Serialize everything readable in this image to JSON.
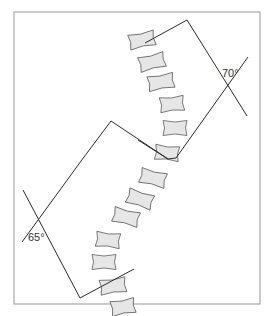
{
  "figure": {
    "frame": {
      "x": 14,
      "y": 12,
      "width": 246,
      "height": 292,
      "stroke": "#a8a8a8"
    },
    "colors": {
      "vertebra_fill": "#e6e6e6",
      "vertebra_stroke": "#6e6e6e",
      "line": "#2a2a2a",
      "text": "#333333"
    }
  },
  "curves": [
    {
      "name": "upper-curve",
      "angle_label": "70°",
      "label_pos": {
        "x": 222,
        "y": 68
      },
      "box": [
        [
          145,
          43
        ],
        [
          187,
          20
        ],
        [
          247,
          116
        ],
        [
          157,
          168
        ]
      ]
    },
    {
      "name": "lower-curve",
      "angle_label": "65°",
      "label_pos": {
        "x": 28,
        "y": 232
      },
      "box": [
        [
          83,
          110
        ],
        [
          108,
          154
        ],
        [
          79,
          296
        ],
        [
          20,
          222
        ]
      ]
    }
  ],
  "vertebrae": [
    {
      "cx": 142,
      "cy": 40,
      "w": 26,
      "h": 15,
      "rot": -12
    },
    {
      "cx": 152,
      "cy": 62,
      "w": 26,
      "h": 15,
      "rot": -14
    },
    {
      "cx": 161,
      "cy": 82,
      "w": 26,
      "h": 15,
      "rot": -10
    },
    {
      "cx": 172,
      "cy": 104,
      "w": 24,
      "h": 15,
      "rot": -6
    },
    {
      "cx": 175,
      "cy": 128,
      "w": 24,
      "h": 15,
      "rot": 0
    },
    {
      "cx": 167,
      "cy": 153,
      "w": 24,
      "h": 15,
      "rot": 6
    },
    {
      "cx": 153,
      "cy": 178,
      "w": 26,
      "h": 15,
      "rot": 14
    },
    {
      "cx": 140,
      "cy": 199,
      "w": 26,
      "h": 15,
      "rot": 18
    },
    {
      "cx": 126,
      "cy": 217,
      "w": 26,
      "h": 15,
      "rot": 14
    },
    {
      "cx": 108,
      "cy": 240,
      "w": 24,
      "h": 15,
      "rot": 6
    },
    {
      "cx": 104,
      "cy": 262,
      "w": 24,
      "h": 15,
      "rot": 0
    },
    {
      "cx": 113,
      "cy": 286,
      "w": 26,
      "h": 15,
      "rot": -8
    },
    {
      "cx": 123,
      "cy": 307,
      "w": 24,
      "h": 15,
      "rot": -10
    }
  ]
}
